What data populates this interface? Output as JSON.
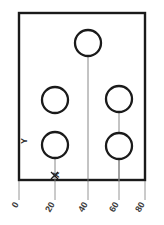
{
  "drawing": {
    "title": "Rectangular plate with five holes",
    "background_color": "#ffffff",
    "line_color": "#1a1a1a",
    "construction_line_color": "#7a7a7a",
    "plate": {
      "label": "plate-outline",
      "x": 19,
      "y": 13,
      "width": 126,
      "height": 167
    },
    "holes": [
      {
        "name": "hole-top-center",
        "cx": 88,
        "cy": 43,
        "r": 13
      },
      {
        "name": "hole-middle-left",
        "cx": 55,
        "cy": 100,
        "r": 13
      },
      {
        "name": "hole-middle-right",
        "cx": 119,
        "cy": 99,
        "r": 13
      },
      {
        "name": "hole-bottom-left",
        "cx": 55,
        "cy": 145,
        "r": 13
      },
      {
        "name": "hole-bottom-right",
        "cx": 119,
        "cy": 146,
        "r": 13
      }
    ],
    "center_lines": [
      {
        "name": "center-line-top-center",
        "x": 88,
        "y1": 43,
        "y2": 181
      },
      {
        "name": "center-line-middle-right",
        "x": 119,
        "y1": 99,
        "y2": 181
      },
      {
        "name": "center-line-bottom-left",
        "x": 55,
        "y1": 145,
        "y2": 181
      },
      {
        "name": "center-line-bottom-right",
        "x": 119,
        "y1": 146,
        "y2": 181
      }
    ],
    "extension_lines": [
      {
        "name": "extension-line-0",
        "x": 19,
        "y1": 181,
        "y2": 200
      },
      {
        "name": "extension-line-20",
        "x": 55,
        "y1": 181,
        "y2": 200
      },
      {
        "name": "extension-line-40",
        "x": 88,
        "y1": 181,
        "y2": 200
      },
      {
        "name": "extension-line-60",
        "x": 119,
        "y1": 181,
        "y2": 200
      },
      {
        "name": "extension-line-80",
        "x": 145,
        "y1": 181,
        "y2": 200
      }
    ],
    "axis_ticks": [
      {
        "label": "0",
        "x": 19,
        "y": 207
      },
      {
        "label": "20",
        "x": 55,
        "y": 212
      },
      {
        "label": "40",
        "x": 88,
        "y": 212
      },
      {
        "label": "60",
        "x": 119,
        "y": 212
      },
      {
        "label": "80",
        "x": 145,
        "y": 212
      }
    ],
    "axis_names": {
      "y_axis": {
        "label": "Y",
        "x": 25,
        "y": 144
      },
      "x_axis": {
        "label": "X",
        "x": 55,
        "y": 176
      }
    },
    "origin": {
      "x": 55,
      "y": 181
    }
  }
}
